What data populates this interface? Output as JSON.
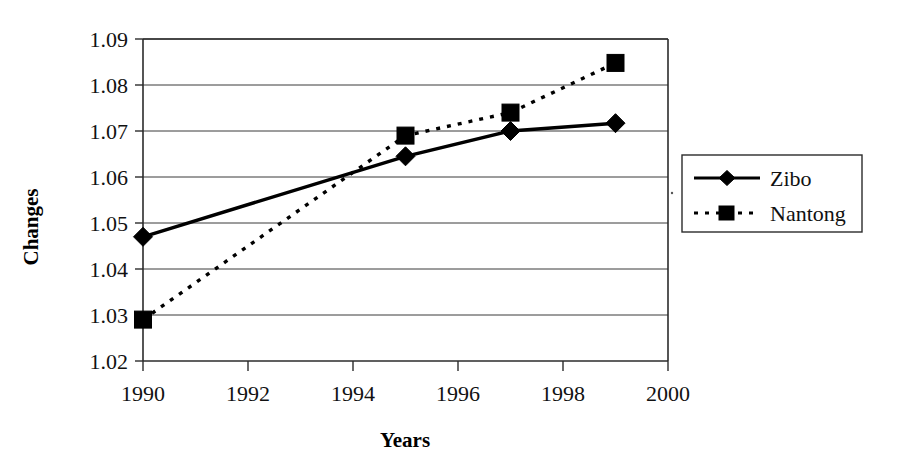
{
  "chart_data": {
    "type": "line",
    "title": "",
    "xlabel": "Years",
    "ylabel": "Changes",
    "x": [
      1990,
      1995,
      1997,
      1999
    ],
    "xlim": [
      1990,
      2000
    ],
    "ylim": [
      1.02,
      1.09
    ],
    "xticks": [
      "1990",
      "1992",
      "1994",
      "1996",
      "1998",
      "2000"
    ],
    "xtick_values": [
      1990,
      1992,
      1994,
      1996,
      1998,
      2000
    ],
    "yticks": [
      "1.02",
      "1.03",
      "1.04",
      "1.05",
      "1.06",
      "1.07",
      "1.08",
      "1.09"
    ],
    "ytick_values": [
      1.02,
      1.03,
      1.04,
      1.05,
      1.06,
      1.07,
      1.08,
      1.09
    ],
    "grid": "horizontal",
    "legend_position": "right-outside",
    "series": [
      {
        "name": "Zibo",
        "marker": "diamond",
        "linestyle": "solid",
        "color": "#000000",
        "x": [
          1990,
          1995,
          1997,
          1999
        ],
        "values": [
          1.047,
          1.0645,
          1.07,
          1.0717
        ]
      },
      {
        "name": "Nantong",
        "marker": "square",
        "linestyle": "dashed",
        "color": "#000000",
        "x": [
          1990,
          1995,
          1997,
          1999
        ],
        "values": [
          1.029,
          1.069,
          1.074,
          1.0848
        ]
      }
    ]
  },
  "axes": {
    "y_title": "Changes",
    "x_title": "Years",
    "y_tick_labels": [
      "1.09",
      "1.08",
      "1.07",
      "1.06",
      "1.05",
      "1.04",
      "1.03",
      "1.02"
    ],
    "x_tick_labels": [
      "1990",
      "1992",
      "1994",
      "1996",
      "1998",
      "2000"
    ]
  },
  "legend": {
    "entries": [
      {
        "label": "Zibo",
        "marker": "diamond-marker",
        "line": "solid-line"
      },
      {
        "label": "Nantong",
        "marker": "square-marker",
        "line": "dashed-line"
      }
    ]
  }
}
